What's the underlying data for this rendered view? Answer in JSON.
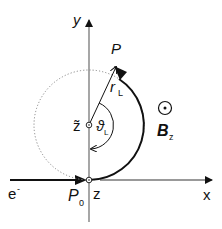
{
  "diagram": {
    "axes": {
      "x_label": "x",
      "y_label": "y"
    },
    "labels": {
      "point_P": "P",
      "radius": "r",
      "radius_sub": "L",
      "center": "z̃",
      "angle": "ϑ",
      "angle_sub": "L",
      "field": "B",
      "field_sub": "z",
      "electron": "e",
      "electron_sup": "-",
      "start_point": "P",
      "start_sub": "0",
      "origin_z": "z"
    },
    "colors": {
      "stroke": "#111111",
      "axis": "#555555",
      "dotted": "#777777"
    }
  }
}
